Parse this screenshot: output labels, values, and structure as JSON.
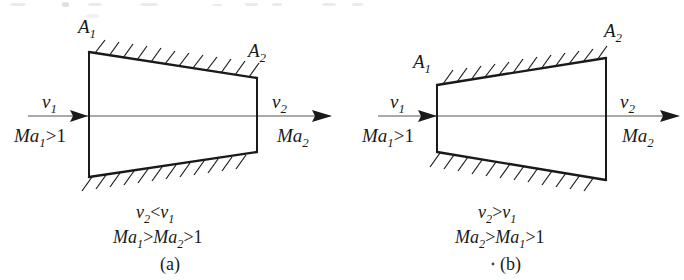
{
  "figure": {
    "kind": "engineering-diagram",
    "background_color": "#ffffff",
    "line_color": "#1a1a1a",
    "panels": [
      {
        "id": "a",
        "caption": "(a)",
        "duct_type": "converging",
        "area_inlet_label": "A",
        "area_inlet_sub": "1",
        "area_outlet_label": "A",
        "area_outlet_sub": "2",
        "velocity_in_label": "v",
        "velocity_in_sub": "1",
        "velocity_out_label": "v",
        "velocity_out_sub": "2",
        "mach_in_label": "Ma",
        "mach_in_sub": "1",
        "mach_in_rel": ">1",
        "mach_out_label": "Ma",
        "mach_out_sub": "2",
        "result_line1": {
          "left_sym": "v",
          "left_sub": "2",
          "op": "<",
          "right_sym": "v",
          "right_sub": "1"
        },
        "result_line2": {
          "first_sym": "Ma",
          "first_sub": "1",
          "op1": ">",
          "second_sym": "Ma",
          "second_sub": "2",
          "op2": ">1"
        }
      },
      {
        "id": "b",
        "caption": "(b)",
        "duct_type": "diverging",
        "area_inlet_label": "A",
        "area_inlet_sub": "1",
        "area_outlet_label": "A",
        "area_outlet_sub": "2",
        "velocity_in_label": "v",
        "velocity_in_sub": "1",
        "velocity_out_label": "v",
        "velocity_out_sub": "2",
        "mach_in_label": "Ma",
        "mach_in_sub": "1",
        "mach_in_rel": ">1",
        "mach_out_label": "Ma",
        "mach_out_sub": "2",
        "result_line1": {
          "left_sym": "v",
          "left_sub": "2",
          "op": ">",
          "right_sym": "v",
          "right_sub": "1"
        },
        "result_line2": {
          "first_sym": "Ma",
          "first_sub": "2",
          "op1": ">",
          "second_sym": "Ma",
          "second_sub": "1",
          "op2": ">1"
        }
      }
    ]
  }
}
